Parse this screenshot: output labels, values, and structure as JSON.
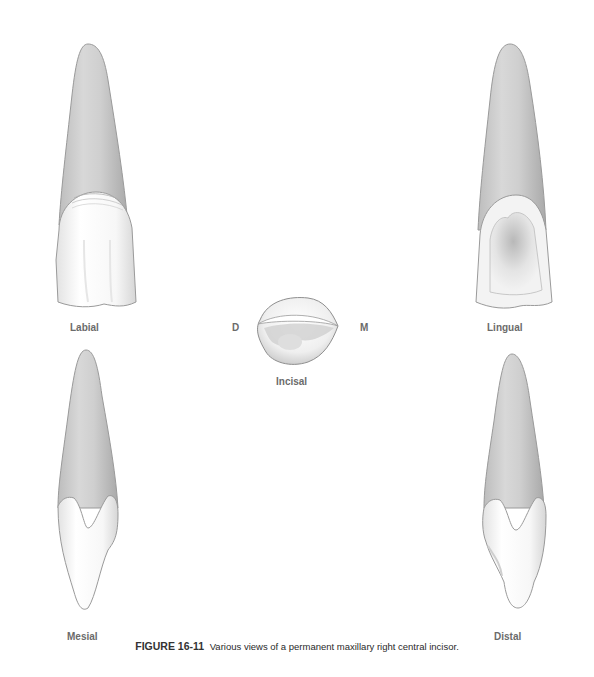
{
  "figure": {
    "number": "FIGURE 16-11",
    "caption": "Various views of a permanent maxillary right central incisor."
  },
  "views": {
    "labial": {
      "label": "Labial"
    },
    "lingual": {
      "label": "Lingual"
    },
    "incisal": {
      "label": "Incisal",
      "left_marker": "D",
      "right_marker": "M"
    },
    "mesial": {
      "label": "Mesial"
    },
    "distal": {
      "label": "Distal"
    }
  },
  "colors": {
    "background": "#ffffff",
    "root_fill": "#c9c9c9",
    "crown_fill": "#f7f7f7",
    "outline": "#8a8a8a",
    "label_text": "#6b6b6b",
    "caption_text": "#2a2a2a"
  }
}
